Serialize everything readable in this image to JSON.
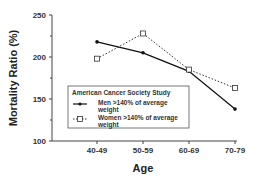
{
  "chart_data": {
    "type": "line",
    "title": "",
    "xlabel": "Age",
    "ylabel": "Mortality Ratio (%)",
    "categories": [
      "40-49",
      "50-59",
      "60-69",
      "70-79"
    ],
    "ylim": [
      100,
      250
    ],
    "yticks": [
      100,
      150,
      200,
      250
    ],
    "yticks_labels": [
      "100",
      "150",
      "200",
      "250"
    ],
    "grid": false,
    "legend": {
      "title": "American Cancer Society Study",
      "placement": "lower-left",
      "entries": [
        {
          "label_line1": "Men >140% of average",
          "label_line2": "weight",
          "marker": "filled-circle",
          "line": "solid"
        },
        {
          "label_line1": "Women >140% of average",
          "label_line2": "weight",
          "marker": "open-square",
          "line": "dotted"
        }
      ]
    },
    "series": [
      {
        "name": "Men >140% of average weight",
        "values": [
          218,
          205,
          183,
          138
        ],
        "color": "#111111",
        "style": "solid",
        "marker": "circle"
      },
      {
        "name": "Women >140% of average weight",
        "values": [
          198,
          228,
          185,
          163
        ],
        "color": "#333333",
        "style": "dotted",
        "marker": "square"
      }
    ]
  }
}
